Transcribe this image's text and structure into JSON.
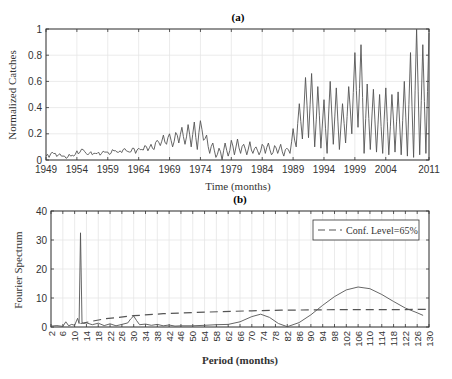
{
  "chart_data": [
    {
      "panel": "(a)",
      "type": "line",
      "title": "(a)",
      "xlabel": "Time (months)",
      "ylabel": "Normalized Catches",
      "xticks": [
        "1949",
        "1954",
        "1959",
        "1964",
        "1969",
        "1974",
        "1979",
        "1984",
        "1989",
        "1994",
        "1999",
        "2004",
        "2011"
      ],
      "xtick_years": [
        1949,
        1954,
        1959,
        1964,
        1969,
        1974,
        1979,
        1984,
        1989,
        1994,
        1999,
        2004,
        2011
      ],
      "yticks": [
        "0",
        "0.2",
        "0.4",
        "0.6",
        "0.8",
        "1"
      ],
      "ylim": [
        0,
        1
      ],
      "xlim": [
        1949,
        2011
      ],
      "grid": true,
      "series": [
        {
          "name": "Normalized Catches",
          "color": "#555555",
          "x": [
            1949.0,
            1949.5,
            1950.0,
            1950.5,
            1951.0,
            1951.5,
            1952.0,
            1952.5,
            1953.0,
            1953.5,
            1954.0,
            1954.5,
            1955.0,
            1955.5,
            1956.0,
            1956.5,
            1957.0,
            1957.5,
            1958.0,
            1958.5,
            1959.0,
            1959.5,
            1960.0,
            1960.5,
            1961.0,
            1961.5,
            1962.0,
            1962.5,
            1963.0,
            1963.5,
            1964.0,
            1964.5,
            1965.0,
            1965.5,
            1966.0,
            1966.5,
            1967.0,
            1967.5,
            1968.0,
            1968.5,
            1969.0,
            1969.5,
            1970.0,
            1970.5,
            1971.0,
            1971.5,
            1972.0,
            1972.5,
            1973.0,
            1973.5,
            1974.0,
            1974.5,
            1975.0,
            1975.5,
            1976.0,
            1976.5,
            1977.0,
            1977.5,
            1978.0,
            1978.5,
            1979.0,
            1979.5,
            1980.0,
            1980.5,
            1981.0,
            1981.5,
            1982.0,
            1982.5,
            1983.0,
            1983.5,
            1984.0,
            1984.5,
            1985.0,
            1985.5,
            1986.0,
            1986.5,
            1987.0,
            1987.5,
            1988.0,
            1988.5,
            1989.0,
            1989.5,
            1990.0,
            1990.5,
            1991.0,
            1991.5,
            1992.0,
            1992.5,
            1993.0,
            1993.5,
            1994.0,
            1994.5,
            1995.0,
            1995.5,
            1996.0,
            1996.5,
            1997.0,
            1997.5,
            1998.0,
            1998.5,
            1999.0,
            1999.5,
            2000.0,
            2000.5,
            2001.0,
            2001.5,
            2002.0,
            2002.5,
            2003.0,
            2003.5,
            2004.0,
            2004.5,
            2005.0,
            2005.5,
            2006.0,
            2006.5,
            2007.0,
            2007.5,
            2008.0,
            2008.5,
            2009.0,
            2009.5,
            2010.0,
            2010.5,
            2011.0
          ],
          "values": [
            0.03,
            0.02,
            0.06,
            0.05,
            0.04,
            0.03,
            0.03,
            0.02,
            0.03,
            0.03,
            0.07,
            0.06,
            0.08,
            0.05,
            0.05,
            0.04,
            0.05,
            0.06,
            0.05,
            0.06,
            0.06,
            0.05,
            0.07,
            0.06,
            0.07,
            0.08,
            0.07,
            0.06,
            0.09,
            0.05,
            0.09,
            0.08,
            0.11,
            0.07,
            0.12,
            0.08,
            0.15,
            0.11,
            0.19,
            0.12,
            0.2,
            0.1,
            0.21,
            0.13,
            0.25,
            0.12,
            0.27,
            0.1,
            0.29,
            0.08,
            0.3,
            0.15,
            0.19,
            0.05,
            0.13,
            0.02,
            0.09,
            0.0,
            0.13,
            0.03,
            0.15,
            0.04,
            0.16,
            0.05,
            0.12,
            0.04,
            0.14,
            0.05,
            0.1,
            0.04,
            0.12,
            0.05,
            0.13,
            0.04,
            0.11,
            0.05,
            0.12,
            0.03,
            0.09,
            0.05,
            0.24,
            0.1,
            0.43,
            0.16,
            0.63,
            0.17,
            0.66,
            0.1,
            0.56,
            0.09,
            0.46,
            0.05,
            0.6,
            0.12,
            0.55,
            0.08,
            0.43,
            0.13,
            0.56,
            0.2,
            0.82,
            0.25,
            0.88,
            0.05,
            0.58,
            0.08,
            0.54,
            0.06,
            0.5,
            0.05,
            0.55,
            0.04,
            0.5,
            0.06,
            0.52,
            0.04,
            0.6,
            0.03,
            0.82,
            0.02,
            1.0,
            0.04,
            0.88,
            0.05,
            0.97,
            0.25,
            0.3
          ]
        }
      ]
    },
    {
      "panel": "(b)",
      "type": "line",
      "title": "(b)",
      "xlabel": "Period (months)",
      "ylabel": "Fourier Spectrum",
      "xticks": [
        "2",
        "6",
        "10",
        "14",
        "18",
        "22",
        "26",
        "30",
        "34",
        "38",
        "42",
        "46",
        "50",
        "54",
        "58",
        "62",
        "66",
        "70",
        "74",
        "78",
        "82",
        "86",
        "90",
        "94",
        "98",
        "102",
        "106",
        "110",
        "114",
        "118",
        "122",
        "126",
        "130"
      ],
      "yticks": [
        "0",
        "10",
        "20",
        "30",
        "40"
      ],
      "ylim": [
        0,
        40
      ],
      "xlim": [
        2,
        130
      ],
      "grid": true,
      "legend": {
        "position": "upper right",
        "entries": [
          "Conf. Level=65%"
        ]
      },
      "series": [
        {
          "name": "Fourier Spectrum",
          "style": "solid",
          "color": "#555555",
          "x": [
            2,
            4,
            6,
            7,
            8,
            9,
            10,
            11,
            11.5,
            12,
            12.5,
            13,
            14,
            16,
            18,
            20,
            22,
            24,
            26,
            28,
            29,
            30,
            31,
            32,
            34,
            36,
            38,
            40,
            42,
            44,
            46,
            50,
            54,
            58,
            62,
            66,
            70,
            73,
            76,
            79,
            82,
            86,
            90,
            94,
            98,
            102,
            106,
            110,
            114,
            118,
            122,
            126,
            128
          ],
          "values": [
            0.3,
            0.5,
            0.2,
            1.8,
            0.4,
            0.9,
            0.6,
            3.0,
            1.2,
            32.5,
            1.5,
            1.2,
            1.4,
            0.8,
            1.3,
            0.5,
            1.1,
            0.4,
            0.9,
            1.4,
            2.8,
            3.8,
            2.2,
            0.8,
            1.0,
            0.6,
            0.9,
            0.4,
            0.7,
            0.3,
            0.4,
            0.4,
            0.6,
            0.8,
            0.9,
            1.8,
            3.6,
            4.4,
            3.3,
            1.2,
            0.1,
            1.5,
            4.2,
            7.5,
            10.5,
            12.8,
            13.8,
            13.2,
            11.2,
            8.8,
            6.5,
            4.9,
            4.0
          ]
        },
        {
          "name": "Conf. Level=65%",
          "style": "dashed",
          "color": "#555555",
          "x": [
            12,
            20,
            30,
            40,
            50,
            60,
            70,
            80,
            90,
            100,
            110,
            120,
            130
          ],
          "values": [
            1.2,
            2.8,
            3.9,
            4.6,
            5.0,
            5.3,
            5.6,
            5.8,
            5.9,
            6.0,
            6.0,
            6.0,
            6.1
          ]
        }
      ]
    }
  ],
  "panels": {
    "a": {
      "title": "(a)",
      "xlabel": "Time (months)",
      "ylabel": "Normalized Catches"
    },
    "b": {
      "title": "(b)",
      "xlabel": "Period (months)",
      "ylabel": "Fourier Spectrum",
      "legend_label": "Conf. Level=65%"
    }
  }
}
